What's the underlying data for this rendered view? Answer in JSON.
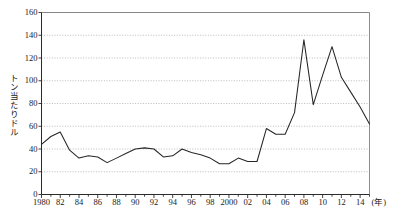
{
  "chart_data": {
    "type": "line",
    "title": "",
    "xlabel": "(年)",
    "ylabel": "トン当たりドル",
    "ylim": [
      0,
      160
    ],
    "xlim": [
      1980,
      2015
    ],
    "ytick_step": 20,
    "xtick_step": 2,
    "grid": "horizontal-dotted",
    "legend": "none",
    "yticks": [
      "0",
      "20",
      "40",
      "60",
      "80",
      "100",
      "120",
      "140",
      "160"
    ],
    "xticks": [
      "1980",
      "82",
      "84",
      "86",
      "88",
      "90",
      "92",
      "94",
      "96",
      "98",
      "2000",
      "02",
      "04",
      "06",
      "08",
      "10",
      "12",
      "14"
    ],
    "x": [
      1980,
      1981,
      1982,
      1983,
      1984,
      1985,
      1986,
      1987,
      1988,
      1989,
      1990,
      1991,
      1992,
      1993,
      1994,
      1995,
      1996,
      1997,
      1998,
      1999,
      2000,
      2001,
      2002,
      2003,
      2004,
      2005,
      2006,
      2007,
      2008,
      2009,
      2010,
      2011,
      2012,
      2013,
      2014,
      2015
    ],
    "series": [
      {
        "name": "トン当たりドル",
        "values": [
          44,
          51,
          55,
          39,
          32,
          34,
          33,
          28,
          32,
          36,
          40,
          41,
          40,
          33,
          34,
          40,
          37,
          35,
          32,
          27,
          27,
          32,
          29,
          29,
          58,
          53,
          53,
          72,
          136,
          79,
          105,
          130,
          103,
          90,
          77,
          62
        ]
      }
    ]
  },
  "axis_unit_suffix": "(年)"
}
